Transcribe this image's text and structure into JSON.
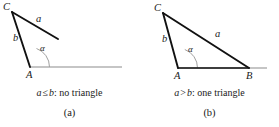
{
  "figure": {
    "colors": {
      "triangle_stroke": "#111111",
      "baseline_stroke": "#8c8c8c",
      "arc_stroke": "#8c8c8c",
      "label_text": "#1a1a1a",
      "background": "#ffffff"
    }
  },
  "panels": [
    {
      "id": "a",
      "letter": "(a)",
      "condition": {
        "left": "a",
        "relation": "≤",
        "right": "b",
        "separator": ":",
        "conclusion": "no triangle",
        "full": "a ≤ b: no triangle"
      },
      "vertices": [
        {
          "name": "C",
          "label": "C",
          "x": 12,
          "y": 12
        },
        {
          "name": "A",
          "label": "A",
          "x": 30,
          "y": 67
        }
      ],
      "sides": [
        {
          "name": "b",
          "label": "b",
          "from": "C",
          "to": "A"
        },
        {
          "name": "a",
          "label": "a",
          "from": "C",
          "to": "free-end"
        }
      ],
      "angle": {
        "name": "alpha",
        "label": "α",
        "at": "A"
      },
      "baseline": {
        "from_x": 30,
        "to_x": 122,
        "y": 67
      }
    },
    {
      "id": "b",
      "letter": "(b)",
      "condition": {
        "left": "a",
        "relation": ">",
        "right": "b",
        "separator": ":",
        "conclusion": "one triangle",
        "full": "a > b: one triangle"
      },
      "vertices": [
        {
          "name": "C",
          "label": "C",
          "x": 23,
          "y": 13
        },
        {
          "name": "A",
          "label": "A",
          "x": 38,
          "y": 68
        },
        {
          "name": "B",
          "label": "B",
          "x": 109,
          "y": 68
        }
      ],
      "sides": [
        {
          "name": "b",
          "label": "b",
          "from": "C",
          "to": "A"
        },
        {
          "name": "a",
          "label": "a",
          "from": "C",
          "to": "B"
        },
        {
          "name": "c",
          "label": "",
          "from": "A",
          "to": "B"
        }
      ],
      "angle": {
        "name": "alpha",
        "label": "α",
        "at": "A"
      },
      "baseline": {
        "from_x": 38,
        "to_x": 127,
        "y": 68
      }
    }
  ]
}
